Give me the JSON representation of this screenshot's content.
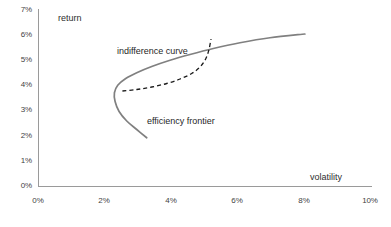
{
  "chart_data": {
    "type": "line",
    "title": "",
    "xlabel": "volatility",
    "ylabel": "return",
    "xlim": [
      0,
      10
    ],
    "ylim": [
      0,
      7
    ],
    "xunit": "%",
    "yunit": "%",
    "grid": false,
    "legend_position": "inline-annotations",
    "xticks": [
      "0%",
      "2%",
      "4%",
      "6%",
      "8%",
      "10%"
    ],
    "xtick_values": [
      0,
      2,
      4,
      6,
      8,
      10
    ],
    "yticks": [
      "0%",
      "1%",
      "2%",
      "3%",
      "4%",
      "5%",
      "6%",
      "7%"
    ],
    "ytick_values": [
      0,
      1,
      2,
      3,
      4,
      5,
      6,
      7
    ],
    "series": [
      {
        "name": "efficiency frontier",
        "style": "solid",
        "color": "#808080",
        "points": [
          [
            3.25,
            1.95
          ],
          [
            2.95,
            2.28
          ],
          [
            2.65,
            2.62
          ],
          [
            2.42,
            3.0
          ],
          [
            2.3,
            3.4
          ],
          [
            2.28,
            3.75
          ],
          [
            2.38,
            4.05
          ],
          [
            2.62,
            4.32
          ],
          [
            2.95,
            4.55
          ],
          [
            3.4,
            4.8
          ],
          [
            3.95,
            5.05
          ],
          [
            4.55,
            5.28
          ],
          [
            5.25,
            5.52
          ],
          [
            6.05,
            5.75
          ],
          [
            6.95,
            5.95
          ],
          [
            8.0,
            6.1
          ]
        ]
      },
      {
        "name": "indifference curve",
        "style": "dashed",
        "color": "#1a1a1a",
        "points": [
          [
            2.52,
            3.82
          ],
          [
            2.95,
            3.88
          ],
          [
            3.4,
            3.98
          ],
          [
            3.85,
            4.12
          ],
          [
            4.25,
            4.3
          ],
          [
            4.6,
            4.52
          ],
          [
            4.85,
            4.78
          ],
          [
            5.02,
            5.1
          ],
          [
            5.12,
            5.48
          ],
          [
            5.18,
            5.9
          ]
        ]
      }
    ],
    "annotations": [
      {
        "text": "indifference curve",
        "x": 2.4,
        "y": 5.25
      },
      {
        "text": "efficiency frontier",
        "x": 3.3,
        "y": 2.82
      },
      {
        "text": "return",
        "x": 0.6,
        "y": 6.85
      },
      {
        "text": "volatility",
        "x": 8.2,
        "y": 0.45
      }
    ],
    "tangency_point": [
      4.78,
      4.64
    ]
  },
  "axes": {
    "y_title": "return",
    "x_title": "volatility"
  },
  "labels": {
    "indifference_curve": "indifference curve",
    "efficiency_frontier": "efficiency frontier"
  },
  "colors": {
    "frontier": "#808080",
    "indifference": "#1a1a1a",
    "axis": "#9a9a9a",
    "text": "#3f3f3f"
  }
}
